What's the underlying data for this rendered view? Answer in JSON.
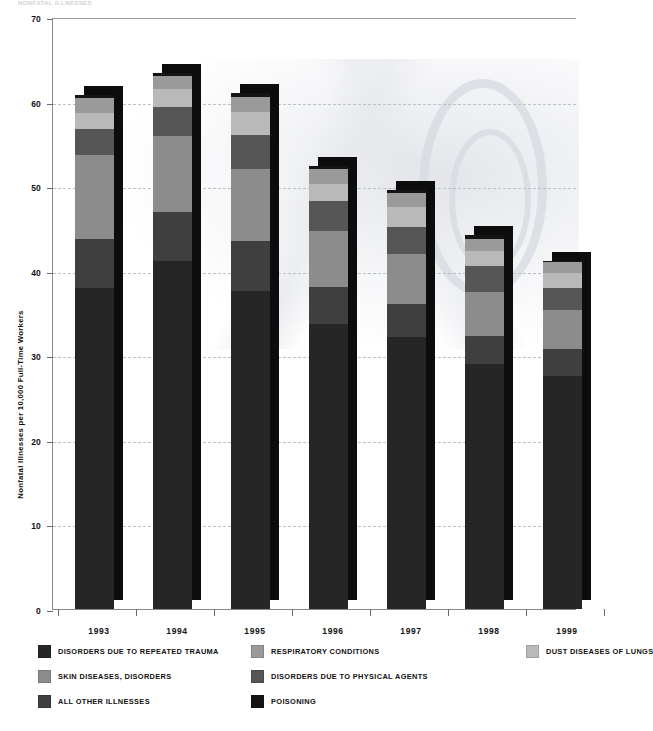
{
  "header": {
    "cut_off_text": "NONFATAL ILLNESSES"
  },
  "axis": {
    "y_label": "Nonfatal Illnesses per 10,000 Full-Time Workers",
    "y_ticks": [
      "0",
      "10",
      "20",
      "30",
      "40",
      "50",
      "60",
      "70"
    ],
    "x_ticks": [
      "1993",
      "1994",
      "1995",
      "1996",
      "1997",
      "1998",
      "1999"
    ]
  },
  "legend": {
    "items": [
      {
        "label": "DISORDERS DUE TO REPEATED TRAUMA",
        "color": "#262626",
        "col": 0,
        "row": 0
      },
      {
        "label": "RESPIRATORY CONDITIONS",
        "color": "#9a9a9a",
        "col": 1,
        "row": 0
      },
      {
        "label": "DUST DISEASES OF LUNGS",
        "color": "#b9b9b9",
        "col": 2,
        "row": 0
      },
      {
        "label": "SKIN DISEASES, DISORDERS",
        "color": "#8c8c8c",
        "col": 0,
        "row": 1
      },
      {
        "label": "DISORDERS DUE TO PHYSICAL AGENTS",
        "color": "#565656",
        "col": 1,
        "row": 1
      },
      {
        "label": "ALL OTHER ILLNESSES",
        "color": "#3f3f3f",
        "col": 0,
        "row": 2
      },
      {
        "label": "POISONING",
        "color": "#141414",
        "col": 1,
        "row": 2
      }
    ]
  },
  "chart_data": {
    "type": "bar",
    "subtype": "stacked-bar-3d",
    "title": "",
    "xlabel": "",
    "ylabel": "Nonfatal Illnesses per 10,000 Full-Time Workers",
    "ylim": [
      0,
      70
    ],
    "ytick_step": 10,
    "grid": true,
    "grid_style": "dashed-horizontal",
    "legend_position": "bottom",
    "categories": [
      "1993",
      "1994",
      "1995",
      "1996",
      "1997",
      "1998",
      "1999"
    ],
    "totals": [
      60.8,
      63.4,
      61.0,
      52.4,
      49.6,
      44.2,
      41.2
    ],
    "series": [
      {
        "name": "DISORDERS DUE TO REPEATED TRAUMA",
        "color": "#262626",
        "values": [
          38.0,
          41.1,
          37.6,
          33.7,
          32.2,
          29.0,
          27.6
        ]
      },
      {
        "name": "ALL OTHER ILLNESSES",
        "color": "#3f3f3f",
        "values": [
          5.8,
          5.8,
          5.9,
          4.4,
          3.9,
          3.3,
          3.2
        ]
      },
      {
        "name": "SKIN DISEASES, DISORDERS",
        "color": "#8c8c8c",
        "values": [
          9.9,
          9.0,
          8.5,
          6.6,
          5.9,
          5.2,
          4.6
        ]
      },
      {
        "name": "DISORDERS DUE TO PHYSICAL AGENTS",
        "color": "#565656",
        "values": [
          3.1,
          3.5,
          4.1,
          3.6,
          3.2,
          3.0,
          2.6
        ]
      },
      {
        "name": "DUST DISEASES OF LUNGS",
        "color": "#b9b9b9",
        "values": [
          1.8,
          2.1,
          2.7,
          2.0,
          2.3,
          1.8,
          1.7
        ]
      },
      {
        "name": "RESPIRATORY CONDITIONS",
        "color": "#9a9a9a",
        "values": [
          1.8,
          1.5,
          1.8,
          1.7,
          1.7,
          1.5,
          1.3
        ]
      },
      {
        "name": "POISONING",
        "color": "#141414",
        "values": [
          0.4,
          0.4,
          0.4,
          0.4,
          0.4,
          0.4,
          0.2
        ]
      }
    ]
  }
}
